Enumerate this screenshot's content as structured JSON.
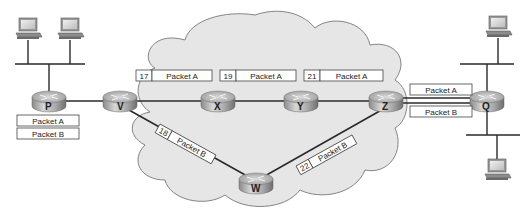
{
  "diagram": {
    "title": "",
    "cloud": {
      "fill": "#e6e6e6",
      "stroke": "#777777"
    },
    "routers": [
      {
        "id": "P",
        "label": "P",
        "x": 33,
        "y": 103
      },
      {
        "id": "V",
        "label": "V",
        "x": 112,
        "y": 103
      },
      {
        "id": "X",
        "label": "X",
        "x": 217,
        "y": 103
      },
      {
        "id": "Y",
        "label": "Y",
        "x": 300,
        "y": 103
      },
      {
        "id": "Z",
        "label": "Z",
        "x": 390,
        "y": 103
      },
      {
        "id": "W",
        "label": "W",
        "x": 256,
        "y": 186
      },
      {
        "id": "Q",
        "label": "Q",
        "x": 487,
        "y": 103
      }
    ],
    "links": [
      [
        "P",
        "V"
      ],
      [
        "V",
        "X"
      ],
      [
        "X",
        "Y"
      ],
      [
        "Y",
        "Z"
      ],
      [
        "V",
        "W"
      ],
      [
        "W",
        "Z"
      ]
    ],
    "packets": {
      "at_P": [
        "Packet A",
        "Packet B"
      ],
      "on_VX": {
        "seq": "17",
        "label": "Packet A"
      },
      "on_XY": {
        "seq": "19",
        "label": "Packet A"
      },
      "on_YZ": {
        "seq": "21",
        "label": "Packet A"
      },
      "on_VW": {
        "seq": "18",
        "label": "Packet B"
      },
      "on_WZ": {
        "seq": "22",
        "label": "Packet B"
      },
      "on_ZQ": [
        "Packet A",
        "Packet B"
      ]
    },
    "hosts": [
      {
        "name": "left-host-1"
      },
      {
        "name": "left-host-2"
      },
      {
        "name": "right-host-top"
      },
      {
        "name": "right-host-bottom"
      }
    ]
  }
}
